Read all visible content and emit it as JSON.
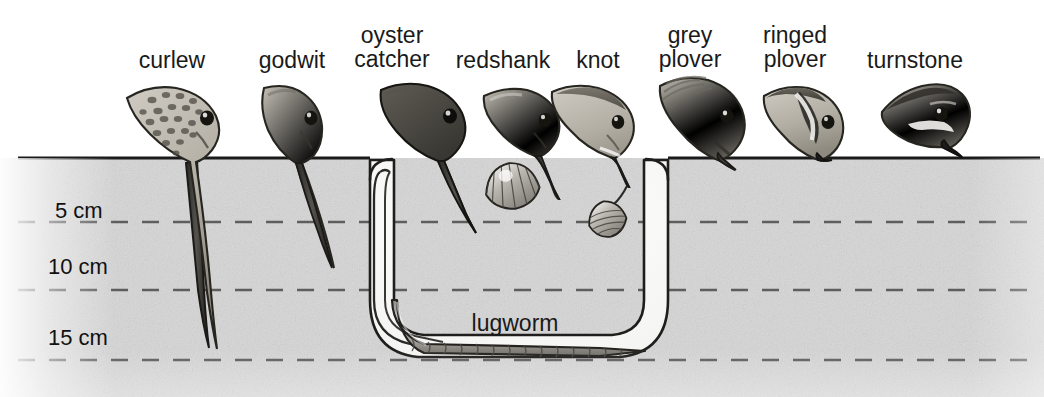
{
  "figure": {
    "width": 1044,
    "height": 397,
    "surface_y": 158,
    "background_color": "#ffffff",
    "sediment_color": "#d6d6d6",
    "line_color": "#1a1a1a"
  },
  "birds": [
    {
      "id": "curlew",
      "label": "curlew",
      "label_x": 172,
      "label_y": 48,
      "probe_depth_cm": 14.0,
      "bill_type": "long-decurved",
      "bill_tip_x": 208,
      "bill_tip_y": 348
    },
    {
      "id": "godwit",
      "label": "godwit",
      "label_x": 292,
      "label_y": 48,
      "probe_depth_cm": 11.0,
      "bill_type": "long-straight",
      "bill_tip_x": 332,
      "bill_tip_y": 268
    },
    {
      "id": "oystercatcher",
      "label": "oyster\ncatcher",
      "label_x": 392,
      "label_y": 23,
      "probe_depth_cm": 7.0,
      "bill_type": "stout-straight",
      "bill_tip_x": 473,
      "bill_tip_y": 232
    },
    {
      "id": "redshank",
      "label": "redshank",
      "label_x": 503,
      "label_y": 48,
      "probe_depth_cm": 4.0,
      "bill_type": "medium-straight",
      "bill_tip_x": 551,
      "bill_tip_y": 198
    },
    {
      "id": "knot",
      "label": "knot",
      "label_x": 598,
      "label_y": 48,
      "probe_depth_cm": 3.0,
      "bill_type": "short-straight",
      "bill_tip_x": 627,
      "bill_tip_y": 185
    },
    {
      "id": "greyplover",
      "label": "grey\nplover",
      "label_x": 690,
      "label_y": 23,
      "probe_depth_cm": 1.5,
      "bill_type": "short-stubby",
      "bill_tip_x": 737,
      "bill_tip_y": 170
    },
    {
      "id": "ringedplover",
      "label": "ringed\nplover",
      "label_x": 795,
      "label_y": 23,
      "probe_depth_cm": 0.3,
      "bill_type": "very-short",
      "bill_tip_x": 833,
      "bill_tip_y": 160
    },
    {
      "id": "turnstone",
      "label": "turnstone",
      "label_x": 915,
      "label_y": 48,
      "probe_depth_cm": 0.0,
      "bill_type": "wedge",
      "bill_tip_x": 955,
      "bill_tip_y": 158
    }
  ],
  "depth_scale": {
    "unit": "cm",
    "ticks": [
      {
        "value": 5,
        "label": "5 cm",
        "y": 222,
        "label_x": 55,
        "label_y": 198
      },
      {
        "value": 10,
        "label": "10 cm",
        "y": 290,
        "label_x": 48,
        "label_y": 254
      },
      {
        "value": 15,
        "label": "15 cm",
        "y": 360,
        "label_x": 48,
        "label_y": 325
      }
    ],
    "line_style": "dashed",
    "line_color": "#5a5a5a"
  },
  "prey": [
    {
      "id": "lugworm",
      "label": "lugworm",
      "label_x": 515,
      "label_y": 310,
      "depth_cm": 15.0,
      "type": "polychaete-worm"
    },
    {
      "id": "cockle",
      "label": "",
      "depth_cm": 2.0,
      "type": "bivalve-shell"
    },
    {
      "id": "bivalve",
      "label": "",
      "depth_cm": 5.0,
      "type": "small-bivalve"
    }
  ],
  "burrow": {
    "type": "u-shaped-lugworm-burrow",
    "left_shaft_x": 385,
    "right_shaft_x": 658,
    "bottom_y": 355
  }
}
